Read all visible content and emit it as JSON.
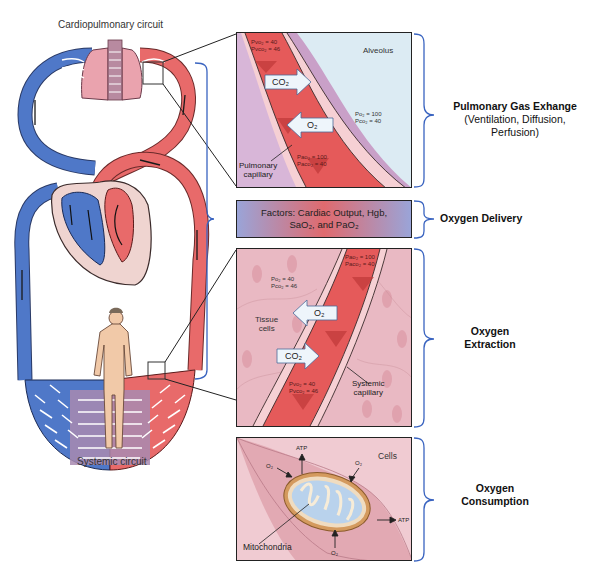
{
  "circulation": {
    "top_label": "Cardiopulmonary circuit",
    "bottom_label": "Systemic circuit"
  },
  "panels": {
    "pulmonary": {
      "pv_o2": "Pvo₂ = 40",
      "pv_co2": "Pvco₂ = 46",
      "alveolus_label": "Alveolus",
      "alveolus_po2": "Po₂ = 100",
      "alveolus_pco2": "Pco₂ = 40",
      "co2_arrow": "CO₂",
      "o2_arrow": "O₂",
      "pa_o2": "Pao₂ = 100",
      "pa_co2": "Paco₂ = 40",
      "capillary_label_1": "Pulmonary",
      "capillary_label_2": "capillary"
    },
    "factors": {
      "line1": "Factors: Cardiac Output, Hgb,",
      "line2": "SaO₂, and PaO₂"
    },
    "extraction": {
      "pa_o2": "Pao₂ = 100",
      "pa_co2": "Paco₂ = 40",
      "tissue_po2": "Po₂ = 40",
      "tissue_pco2": "Pco₂ = 46",
      "tissue_label_1": "Tissue",
      "tissue_label_2": "cells",
      "o2_arrow": "O₂",
      "co2_arrow": "CO₂",
      "pv_o2": "Pvo₂ = 40",
      "pv_co2": "Pvco₂ = 46",
      "capillary_label_1": "Systemic",
      "capillary_label_2": "capillary"
    },
    "consumption": {
      "cells_label": "Cells",
      "atp_top": "ATP",
      "atp_right": "ATP",
      "o2_left": "O₂",
      "o2_right": "O₂",
      "o2_bottom": "O₂",
      "mito_label": "Mitochondria"
    }
  },
  "stages": [
    {
      "title": "Pulmonary Gas Exhange",
      "subtitle_1": "(Ventilation, Diffusion,",
      "subtitle_2": "Perfusion)"
    },
    {
      "title": "Oxygen Delivery"
    },
    {
      "title_1": "Oxygen",
      "title_2": "Extraction"
    },
    {
      "title_1": "Oxygen",
      "title_2": "Consumption"
    }
  ],
  "colors": {
    "artery": "#e86a6a",
    "vein": "#4f78c8",
    "bracket": "#3a64c0",
    "alveolus": "#dcebf3",
    "tissue": "#e9b9c3"
  }
}
